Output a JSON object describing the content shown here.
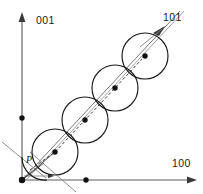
{
  "figure": {
    "kind": "crystallographic-direction-diagram",
    "background_color": "#ffffff",
    "axes": {
      "vertical": {
        "label": "001",
        "label_x": 36,
        "label_y": 24,
        "x": 22,
        "y_top": 14,
        "y_bottom": 180,
        "color": "#5a5a5a"
      },
      "horizontal": {
        "label": "100",
        "label_x": 172,
        "label_y": 167,
        "y": 180,
        "x_left": 22,
        "x_right": 196,
        "color": "#5a5a5a"
      },
      "diagonal": {
        "label": "101",
        "label_x": 163,
        "label_y": 21,
        "color": "#6b6b6b"
      }
    },
    "point_label": {
      "text": "P",
      "x": 26,
      "y": 163
    },
    "atoms": [
      {
        "cx": 55,
        "cy": 152,
        "r": 23
      },
      {
        "cx": 85,
        "cy": 120,
        "r": 23
      },
      {
        "cx": 115,
        "cy": 88,
        "r": 23
      },
      {
        "cx": 145,
        "cy": 56,
        "r": 23
      }
    ],
    "atom_centers_color": "#111111",
    "axis_nodes": [
      {
        "x": 22,
        "y": 180,
        "note": "origin"
      },
      {
        "x": 22,
        "y": 118,
        "note": "on-001-axis"
      },
      {
        "x": 86,
        "y": 180,
        "note": "on-100-axis"
      }
    ],
    "row_direction": {
      "from_x": 22,
      "from_y": 180,
      "to_x": 178,
      "to_y": 13,
      "arrow_at_x": 160,
      "arrow_at_y": 31
    },
    "colors": {
      "ink": "#1a1a1a",
      "axis": "#5a5a5a",
      "row": "#6b6b6b",
      "dash": "#2b2b2b"
    }
  }
}
